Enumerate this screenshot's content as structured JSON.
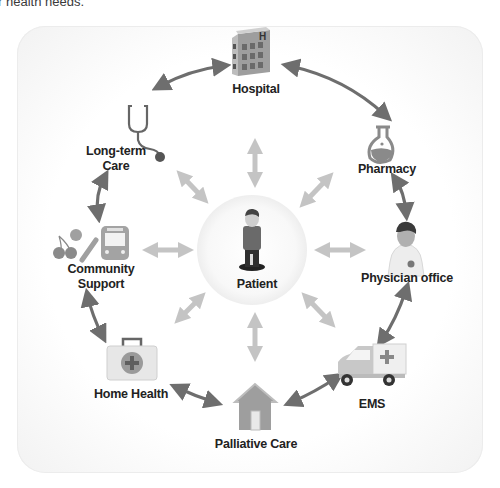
{
  "caption": "r health needs.",
  "center": {
    "label": "Patient",
    "icon": "patient-icon"
  },
  "nodes": [
    {
      "id": "hospital",
      "label": "Hospital",
      "icon": "hospital-building-icon"
    },
    {
      "id": "pharmacy",
      "label": "Pharmacy",
      "icon": "flask-icon"
    },
    {
      "id": "physician",
      "label": "Physician office",
      "icon": "doctor-icon"
    },
    {
      "id": "ems",
      "label": "EMS",
      "icon": "ambulance-icon"
    },
    {
      "id": "palliative",
      "label": "Palliative Care",
      "icon": "house-icon"
    },
    {
      "id": "homehealth",
      "label": "Home Health",
      "icon": "medical-kit-icon"
    },
    {
      "id": "community",
      "label_line1": "Community",
      "label_line2": "Support",
      "icon": "food-and-bus-icon"
    },
    {
      "id": "longterm",
      "label_line1": "Long-term",
      "label_line2": "Care",
      "icon": "stethoscope-icon"
    }
  ],
  "colors": {
    "outer_arrow": "#6e6e6e",
    "inner_arrow": "#c4c4c4",
    "icon_gray": "#8a8a8a",
    "center_fill": "#f7f7f7",
    "text": "#222222"
  }
}
